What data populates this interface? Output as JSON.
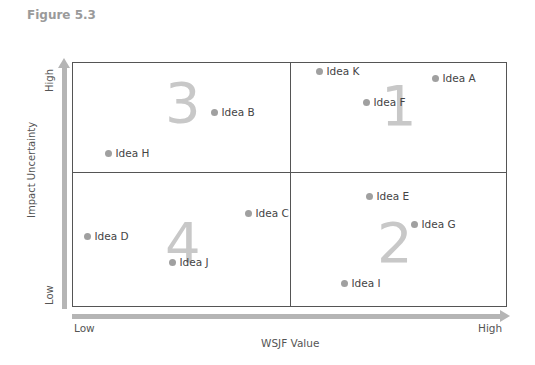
{
  "figure_title": "Figure 5.3",
  "axes": {
    "y_label": "Impact Uncertainty",
    "y_high": "High",
    "y_low": "Low",
    "x_label": "WSJF Value",
    "x_low": "Low",
    "x_high": "High"
  },
  "quadrants": {
    "q1": "1",
    "q2": "2",
    "q3": "3",
    "q4": "4"
  },
  "ideas": [
    {
      "label": "Idea A",
      "x": 435,
      "y": 79
    },
    {
      "label": "Idea B",
      "x": 214,
      "y": 113
    },
    {
      "label": "Idea C",
      "x": 248,
      "y": 214
    },
    {
      "label": "Idea D",
      "x": 87,
      "y": 237
    },
    {
      "label": "Idea E",
      "x": 369,
      "y": 197
    },
    {
      "label": "Idea F",
      "x": 366,
      "y": 103
    },
    {
      "label": "Idea G",
      "x": 414,
      "y": 225
    },
    {
      "label": "Idea H",
      "x": 108,
      "y": 154
    },
    {
      "label": "Idea I",
      "x": 344,
      "y": 284
    },
    {
      "label": "Idea J",
      "x": 172,
      "y": 263
    },
    {
      "label": "Idea K",
      "x": 319,
      "y": 72
    }
  ]
}
